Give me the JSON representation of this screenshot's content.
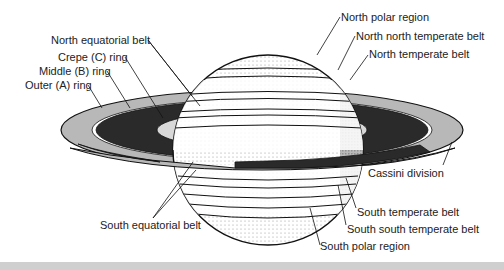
{
  "diagram": {
    "labels": {
      "north_equatorial_belt": "North equatorial belt",
      "crepe_ring": "Crepe (C) ring",
      "middle_ring": "Middle (B) ring",
      "outer_ring": "Outer (A) ring",
      "north_polar_region": "North polar region",
      "north_north_temperate_belt": "North north temperate belt",
      "north_temperate_belt": "North temperate belt",
      "cassini_division": "Cassini division",
      "south_equatorial_belt": "South equatorial belt",
      "south_temperate_belt": "South temperate belt",
      "south_south_temperate_belt": "South south temperate belt",
      "south_polar_region": "South polar region"
    },
    "colors": {
      "outline": "#111111",
      "outer_ring": "#b8b8b8",
      "middle_ring": "#2a2a2a",
      "crepe_ring": "#d8d8d8",
      "band": "#cfcfcf"
    }
  }
}
